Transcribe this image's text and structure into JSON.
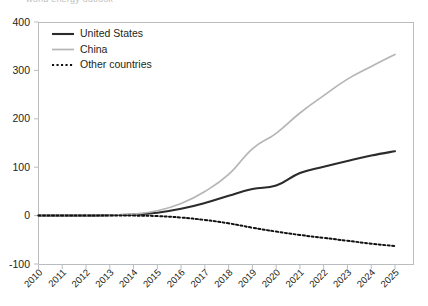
{
  "title_sliver": "world energy outlook",
  "chart_data": {
    "type": "line",
    "title": "",
    "xlabel": "",
    "ylabel": "",
    "x": [
      2010,
      2011,
      2012,
      2013,
      2014,
      2015,
      2016,
      2017,
      2018,
      2019,
      2020,
      2021,
      2022,
      2023,
      2024,
      2025
    ],
    "categories": [
      "2010",
      "2011",
      "2012",
      "2013",
      "2014",
      "2015",
      "2016",
      "2017",
      "2018",
      "2019",
      "2020",
      "2021",
      "2022",
      "2023",
      "2024",
      "2025"
    ],
    "ylim": [
      -100,
      400
    ],
    "xlim": [
      2010,
      2025
    ],
    "yticks": [
      -100,
      0,
      100,
      200,
      300,
      400
    ],
    "ytick_labels": [
      "-100",
      "0",
      "100",
      "200",
      "300",
      "400"
    ],
    "grid": false,
    "legend_position": "top-left",
    "series": [
      {
        "name": "United States",
        "color": "#2b2b2b",
        "style": "solid",
        "width": 2.1,
        "values": [
          0,
          0,
          0,
          1,
          2,
          6,
          14,
          26,
          41,
          55,
          62,
          88,
          101,
          113,
          124,
          133
        ]
      },
      {
        "name": "China",
        "color": "#b5b5b5",
        "style": "solid",
        "width": 1.7,
        "values": [
          0,
          0,
          0,
          1,
          3,
          10,
          25,
          50,
          85,
          138,
          170,
          212,
          248,
          282,
          308,
          333
        ]
      },
      {
        "name": "Other countries",
        "color": "#111111",
        "style": "dotted",
        "width": 2.0,
        "values": [
          0,
          0,
          0,
          0,
          0,
          -1,
          -4,
          -9,
          -16,
          -25,
          -33,
          -40,
          -46,
          -52,
          -58,
          -63
        ]
      }
    ]
  },
  "legend": {
    "items": [
      {
        "label": "United States"
      },
      {
        "label": "China"
      },
      {
        "label": "Other countries"
      }
    ]
  }
}
